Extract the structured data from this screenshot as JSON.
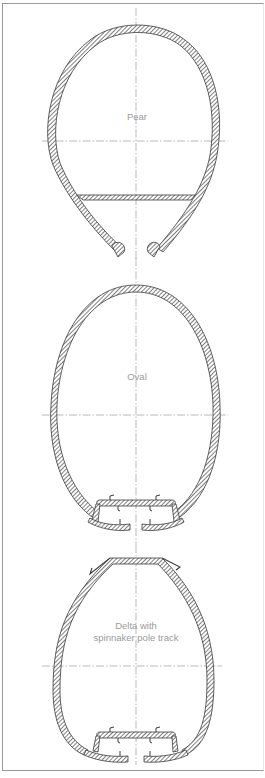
{
  "figure": {
    "colors": {
      "stroke": "#3a3a3a",
      "hatch": "#3a3a3a",
      "centerline": "#8a8a8a",
      "label": "#9a9a9a",
      "frame": "#9a9a9a"
    },
    "sections": [
      {
        "id": "pear",
        "label_lines": [
          "Pear"
        ]
      },
      {
        "id": "oval",
        "label_lines": [
          "Oval"
        ]
      },
      {
        "id": "delta",
        "label_lines": [
          "Delta with",
          "spinnaker pole track"
        ]
      }
    ]
  }
}
